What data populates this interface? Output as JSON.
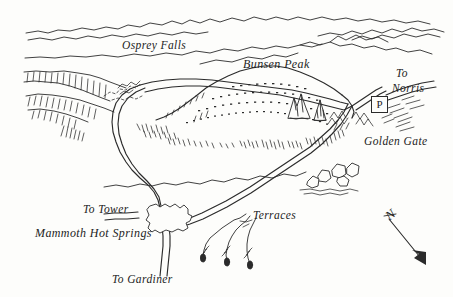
{
  "map": {
    "title": "Bunsen Peak Area Map",
    "medium": "pen-and-ink perspective sketch map",
    "ink_color": "#2b2b2b",
    "paper_color": "#fdfdfb",
    "width": 453,
    "height": 297
  },
  "labels": {
    "osprey_falls": "Osprey Falls",
    "bunsen_peak": "Bunsen Peak",
    "to_norris_line1": "To",
    "to_norris_line2": "Norris",
    "golden_gate": "Golden Gate",
    "to_tower": "To Tower",
    "mammoth_hot_springs": "Mammoth Hot Springs",
    "terraces": "Terraces",
    "to_gardiner": "To Gardiner",
    "parking": "P",
    "north": "N"
  },
  "features": [
    {
      "name": "bunsen-peak",
      "type": "summit",
      "label": "Bunsen Peak"
    },
    {
      "name": "osprey-falls",
      "type": "waterfall",
      "label": "Osprey Falls"
    },
    {
      "name": "golden-gate",
      "type": "canyon",
      "label": "Golden Gate"
    },
    {
      "name": "mammoth-hot-springs",
      "type": "settlement",
      "label": "Mammoth Hot Springs"
    },
    {
      "name": "terraces",
      "type": "travertine-terraces",
      "label": "Terraces"
    },
    {
      "name": "parking-area",
      "type": "parking",
      "label": "P"
    },
    {
      "name": "boulder-field",
      "type": "rocks",
      "label": ""
    },
    {
      "name": "rock-spires",
      "type": "rocks",
      "label": ""
    }
  ],
  "routes": [
    {
      "name": "to-norris",
      "label": "To Norris",
      "direction": "northeast"
    },
    {
      "name": "to-tower",
      "label": "To Tower",
      "direction": "west"
    },
    {
      "name": "to-gardiner",
      "label": "To Gardiner",
      "direction": "south"
    },
    {
      "name": "bunsen-peak-loop-road",
      "label": "",
      "direction": "loop"
    }
  ],
  "compass": {
    "label": "N",
    "arrow_direction": "southeast"
  }
}
